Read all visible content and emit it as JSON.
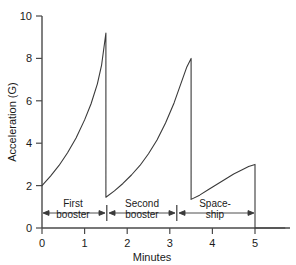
{
  "chart_data": {
    "type": "line",
    "title": "",
    "subtitle": "",
    "xlabel": "Minutes",
    "ylabel": "Acceleration (G)",
    "xlim": [
      0,
      5.7
    ],
    "ylim": [
      0,
      10
    ],
    "grid": false,
    "legend": "none",
    "x_ticks": [
      0,
      1,
      2,
      3,
      4,
      5
    ],
    "x_tick_labels": [
      "0",
      "1",
      "2",
      "3",
      "4",
      "5"
    ],
    "y_ticks": [
      0,
      2,
      4,
      6,
      8,
      10
    ],
    "y_tick_labels": [
      "0",
      "2",
      "4",
      "6",
      "8",
      "10"
    ],
    "series": [
      {
        "name": "Acceleration profile",
        "x": [
          0.0,
          0.2,
          0.4,
          0.6,
          0.8,
          1.0,
          1.15,
          1.3,
          1.4,
          1.5,
          1.5,
          1.7,
          1.9,
          2.1,
          2.3,
          2.5,
          2.7,
          2.9,
          3.1,
          3.25,
          3.4,
          3.5,
          3.5,
          3.7,
          3.9,
          4.1,
          4.3,
          4.5,
          4.7,
          4.85,
          5.0,
          5.0,
          5.7
        ],
        "y": [
          2.0,
          2.45,
          2.95,
          3.55,
          4.25,
          5.1,
          5.85,
          6.8,
          7.7,
          9.2,
          1.45,
          1.75,
          2.1,
          2.5,
          2.95,
          3.5,
          4.15,
          4.95,
          5.9,
          6.75,
          7.6,
          8.0,
          1.35,
          1.55,
          1.8,
          2.05,
          2.3,
          2.55,
          2.75,
          2.9,
          3.0,
          0.0,
          0.0
        ]
      }
    ],
    "annotations": [
      {
        "label_lines": [
          "First",
          "booster"
        ],
        "x_start": 0.0,
        "x_end": 1.5,
        "y": 0.72,
        "style": "double-arrow"
      },
      {
        "label_lines": [
          "Second",
          "booster"
        ],
        "x_start": 1.5,
        "x_end": 3.5,
        "y": 0.72,
        "style": "double-arrow"
      },
      {
        "label_lines": [
          "Space-",
          "ship"
        ],
        "x_start": 3.5,
        "x_end": 5.0,
        "y": 0.72,
        "style": "double-arrow"
      }
    ],
    "phase_boundaries": [
      1.5,
      3.5,
      5.0
    ],
    "peaks": [
      {
        "x": 1.5,
        "y": 9.2
      },
      {
        "x": 3.5,
        "y": 8.0
      },
      {
        "x": 5.0,
        "y": 3.0
      }
    ],
    "troughs": [
      {
        "x": 0.0,
        "y": 2.0
      },
      {
        "x": 1.5,
        "y": 1.45
      },
      {
        "x": 3.5,
        "y": 1.35
      },
      {
        "x": 5.0,
        "y": 0.0
      }
    ],
    "colors": {
      "line": "#3a3a3a",
      "axis": "#4a4a4a",
      "text": "#1a1a1a",
      "background": "#ffffff"
    }
  }
}
